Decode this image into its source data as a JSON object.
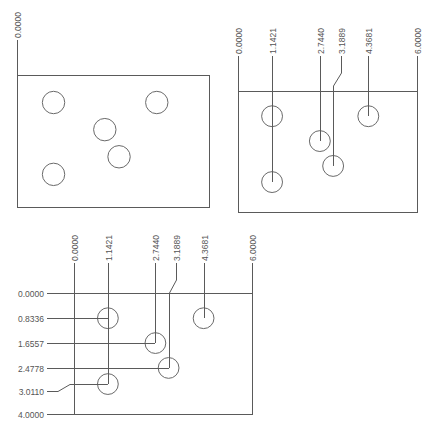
{
  "drawing": {
    "line_color": "#5a5a5a",
    "panels": [
      {
        "id": "plain",
        "x_ordinates": [
          {
            "label": "0.0000",
            "value": 0.0
          }
        ],
        "y_ordinates": [],
        "plate": {
          "width": 6.0,
          "height": 4.0
        },
        "holes": [
          {
            "x": 1.1421,
            "y": 0.8336
          },
          {
            "x": 4.3681,
            "y": 0.8336
          },
          {
            "x": 2.744,
            "y": 1.6557
          },
          {
            "x": 3.1889,
            "y": 2.4778
          },
          {
            "x": 1.1421,
            "y": 3.011
          }
        ],
        "hole_diameter": 0.7
      },
      {
        "id": "x-dimensioned",
        "x_ordinates": [
          {
            "label": "0.0000",
            "value": 0.0
          },
          {
            "label": "1.1421",
            "value": 1.1421
          },
          {
            "label": "2.7440",
            "value": 2.744
          },
          {
            "label": "3.1889",
            "value": 3.1889
          },
          {
            "label": "4.3681",
            "value": 4.3681
          },
          {
            "label": "6.0000",
            "value": 6.0
          }
        ],
        "y_ordinates": [],
        "plate": {
          "width": 6.0,
          "height": 4.0
        },
        "holes": [
          {
            "x": 1.1421,
            "y": 0.8336
          },
          {
            "x": 4.3681,
            "y": 0.8336
          },
          {
            "x": 2.744,
            "y": 1.6557
          },
          {
            "x": 3.1889,
            "y": 2.4778
          },
          {
            "x": 1.1421,
            "y": 3.011
          }
        ],
        "hole_diameter": 0.7
      },
      {
        "id": "xy-dimensioned",
        "x_ordinates": [
          {
            "label": "0.0000",
            "value": 0.0
          },
          {
            "label": "1.1421",
            "value": 1.1421
          },
          {
            "label": "2.7440",
            "value": 2.744
          },
          {
            "label": "3.1889",
            "value": 3.1889
          },
          {
            "label": "4.3681",
            "value": 4.3681
          },
          {
            "label": "6.0000",
            "value": 6.0
          }
        ],
        "y_ordinates": [
          {
            "label": "0.0000",
            "value": 0.0
          },
          {
            "label": "0.8336",
            "value": 0.8336
          },
          {
            "label": "1.6557",
            "value": 1.6557
          },
          {
            "label": "2.4778",
            "value": 2.4778
          },
          {
            "label": "3.0110",
            "value": 3.011
          },
          {
            "label": "4.0000",
            "value": 4.0
          }
        ],
        "plate": {
          "width": 6.0,
          "height": 4.0
        },
        "holes": [
          {
            "x": 1.1421,
            "y": 0.8336
          },
          {
            "x": 4.3681,
            "y": 0.8336
          },
          {
            "x": 2.744,
            "y": 1.6557
          },
          {
            "x": 3.1889,
            "y": 2.4778
          },
          {
            "x": 1.1421,
            "y": 3.011
          }
        ],
        "hole_diameter": 0.7
      }
    ]
  }
}
